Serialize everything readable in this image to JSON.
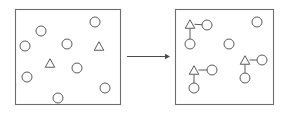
{
  "figure": {
    "title": "",
    "width": 283,
    "height": 114,
    "background": "#ffffff",
    "stroke_color": "#5a5a5a",
    "panel_border_color": "#6d6d6d",
    "arrow_color": "#4a4a4a"
  },
  "chart_data": {
    "type": "diagram",
    "title": "",
    "xlabel": "",
    "ylabel": "",
    "panels": [
      {
        "name": "left-panel",
        "label": "",
        "rect": {
          "x": 15,
          "y": 9,
          "width": 105,
          "height": 95
        },
        "nodes": [
          {
            "id": "L1",
            "shape": "circle",
            "cx": 41,
            "cy": 31,
            "r": 5
          },
          {
            "id": "L2",
            "shape": "circle",
            "cx": 25,
            "cy": 46,
            "r": 5
          },
          {
            "id": "L3",
            "shape": "circle",
            "cx": 95,
            "cy": 22,
            "r": 5
          },
          {
            "id": "L4",
            "shape": "circle",
            "cx": 67,
            "cy": 44,
            "r": 5
          },
          {
            "id": "L5",
            "shape": "triangle",
            "cx": 99,
            "cy": 46,
            "r": 5
          },
          {
            "id": "L6",
            "shape": "triangle",
            "cx": 50,
            "cy": 63,
            "r": 5
          },
          {
            "id": "L7",
            "shape": "circle",
            "cx": 27,
            "cy": 77,
            "r": 5
          },
          {
            "id": "L8",
            "shape": "circle",
            "cx": 77,
            "cy": 68,
            "r": 5
          },
          {
            "id": "L9",
            "shape": "circle",
            "cx": 58,
            "cy": 98,
            "r": 5
          },
          {
            "id": "L10",
            "shape": "circle",
            "cx": 105,
            "cy": 88,
            "r": 5
          }
        ],
        "links": []
      },
      {
        "name": "right-panel",
        "label": "",
        "rect": {
          "x": 175,
          "y": 9,
          "width": 98,
          "height": 95
        },
        "nodes": [
          {
            "id": "R1",
            "shape": "triangle",
            "cx": 190,
            "cy": 24,
            "r": 5
          },
          {
            "id": "R2",
            "shape": "circle",
            "cx": 207,
            "cy": 25,
            "r": 5
          },
          {
            "id": "R3",
            "shape": "circle",
            "cx": 190,
            "cy": 44,
            "r": 5
          },
          {
            "id": "R4",
            "shape": "circle",
            "cx": 257,
            "cy": 22,
            "r": 5
          },
          {
            "id": "R5",
            "shape": "circle",
            "cx": 229,
            "cy": 44,
            "r": 5
          },
          {
            "id": "R6",
            "shape": "triangle",
            "cx": 245,
            "cy": 60,
            "r": 5
          },
          {
            "id": "R7",
            "shape": "circle",
            "cx": 262,
            "cy": 60,
            "r": 5
          },
          {
            "id": "R8",
            "shape": "circle",
            "cx": 245,
            "cy": 78,
            "r": 5
          },
          {
            "id": "R9",
            "shape": "triangle",
            "cx": 194,
            "cy": 70,
            "r": 5
          },
          {
            "id": "R10",
            "shape": "circle",
            "cx": 212,
            "cy": 70,
            "r": 5
          },
          {
            "id": "R11",
            "shape": "circle",
            "cx": 194,
            "cy": 88,
            "r": 5
          }
        ],
        "links": [
          {
            "from": "R1",
            "to": "R2"
          },
          {
            "from": "R1",
            "to": "R3"
          },
          {
            "from": "R6",
            "to": "R7"
          },
          {
            "from": "R6",
            "to": "R8"
          },
          {
            "from": "R9",
            "to": "R10"
          },
          {
            "from": "R9",
            "to": "R11"
          }
        ]
      }
    ],
    "arrow": {
      "name": "transformation-arrow",
      "label": "",
      "x1": 127,
      "y1": 56,
      "x2": 170,
      "y2": 56,
      "direction": "left-to-right"
    }
  }
}
